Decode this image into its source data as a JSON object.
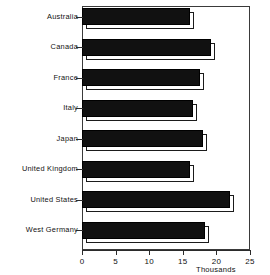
{
  "chart_data": {
    "type": "bar",
    "orientation": "horizontal",
    "title": "",
    "xlabel": "Thousands",
    "ylabel": "",
    "categories": [
      "Australia",
      "Canada",
      "France",
      "Italy",
      "Japan",
      "United Kingdom",
      "United States",
      "West Germany"
    ],
    "values": [
      16.1,
      19.2,
      17.6,
      16.5,
      18.0,
      16.1,
      22.0,
      18.3
    ],
    "xlim": [
      0,
      25
    ],
    "xticks": [
      0,
      5,
      10,
      15,
      20,
      25
    ],
    "xtick_labels": [
      "0",
      "5",
      "10",
      "15",
      "20",
      "25"
    ],
    "grid": false,
    "legend": false,
    "style": "3d-shadow-bars",
    "bar_color": "#111111",
    "frame_color": "#3a3a3a"
  },
  "axis": {
    "unit_label": "Thousands"
  }
}
